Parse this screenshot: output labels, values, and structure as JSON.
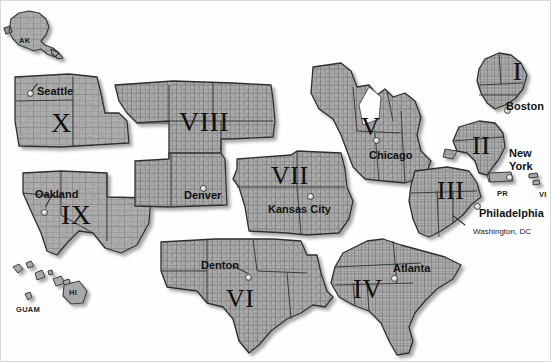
{
  "map": {
    "title": "United States Federal Regions Map",
    "background_color": "#fefefe",
    "land_fill_color": "#a9a9a9",
    "county_line_color": "#6e6e6e",
    "state_line_color": "#2f2f2f",
    "border_color": "#d9d9d9",
    "label_color": "#141414"
  },
  "regions": [
    {
      "numeral": "I",
      "city": "Boston",
      "numeral_x": 512,
      "numeral_y": 58,
      "numeral_size": 26,
      "city_x": 505,
      "city_y": 100,
      "pin_x": 503,
      "pin_y": 106
    },
    {
      "numeral": "II",
      "city": "New York",
      "city_line1": "New",
      "city_line2": "York",
      "numeral_x": 471,
      "numeral_y": 132,
      "numeral_size": 26,
      "city_x": 508,
      "city_y": 147,
      "pin_x": 505,
      "pin_y": 173
    },
    {
      "numeral": "III",
      "city": "Philadelphia",
      "numeral_x": 436,
      "numeral_y": 177,
      "numeral_size": 26,
      "city_x": 478,
      "city_y": 207,
      "pin_x": 473,
      "pin_y": 202
    },
    {
      "numeral": "IV",
      "city": "Atlanta",
      "numeral_x": 352,
      "numeral_y": 275,
      "numeral_size": 27,
      "city_x": 392,
      "city_y": 262,
      "pin_x": 390,
      "pin_y": 274
    },
    {
      "numeral": "V",
      "city": "Chicago",
      "numeral_x": 360,
      "numeral_y": 113,
      "numeral_size": 26,
      "city_x": 368,
      "city_y": 149,
      "pin_x": 372,
      "pin_y": 136
    },
    {
      "numeral": "VI",
      "city": "Denton",
      "numeral_x": 225,
      "numeral_y": 285,
      "numeral_size": 26,
      "city_x": 200,
      "city_y": 259,
      "pin_x": 244,
      "pin_y": 273
    },
    {
      "numeral": "VII",
      "city": "Kansas City",
      "numeral_x": 270,
      "numeral_y": 162,
      "numeral_size": 26,
      "city_x": 267,
      "city_y": 203,
      "pin_x": 306,
      "pin_y": 192
    },
    {
      "numeral": "VIII",
      "city": "Denver",
      "numeral_x": 178,
      "numeral_y": 107,
      "numeral_size": 28,
      "city_x": 183,
      "city_y": 189,
      "pin_x": 199,
      "pin_y": 184
    },
    {
      "numeral": "IX",
      "city": "Oakland",
      "numeral_x": 60,
      "numeral_y": 200,
      "numeral_size": 28,
      "city_x": 34,
      "city_y": 188,
      "pin_x": 40,
      "pin_y": 208
    },
    {
      "numeral": "X",
      "city": "Seattle",
      "numeral_x": 50,
      "numeral_y": 108,
      "numeral_size": 28,
      "city_x": 36,
      "city_y": 85,
      "pin_x": 26,
      "pin_y": 89
    }
  ],
  "territories": [
    {
      "label": "AK",
      "x": 18,
      "y": 36
    },
    {
      "label": "HI",
      "x": 68,
      "y": 288
    },
    {
      "label": "GUAM",
      "x": 15,
      "y": 305
    },
    {
      "label": "PR",
      "x": 496,
      "y": 189
    },
    {
      "label": "VI",
      "x": 538,
      "y": 190
    }
  ],
  "annotations": [
    {
      "label": "Washington, DC",
      "x": 472,
      "y": 227
    }
  ]
}
